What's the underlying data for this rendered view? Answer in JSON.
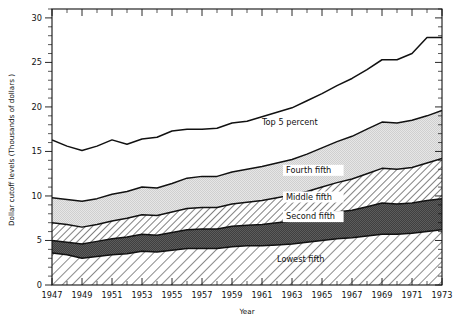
{
  "figure": {
    "ylabel": "Dollar cutoff levels (Thousands of dollars )",
    "xlabel": "Year"
  },
  "labels": {
    "top5": "Top 5 percent",
    "fourth": "Fourth fifth",
    "middle": "Middle fifth",
    "second": "Second fifth",
    "lowest": "Lowest fifth"
  },
  "colors": {
    "line": "#111111",
    "frame": "#111111",
    "lowest_fifth": "#f2f2f2",
    "second_fifth": "#4a4a4a",
    "middle_fifth": "#d8d8d8",
    "fourth_fifth": "#dcdcdc",
    "background": "#ffffff"
  },
  "chart_data": {
    "type": "area",
    "title": "",
    "xlabel": "Year",
    "ylabel": "Dollar cutoff levels (Thousands of dollars )",
    "xlim": [
      1947,
      1973
    ],
    "ylim": [
      0,
      31
    ],
    "grid": false,
    "legend": "inline-annotations",
    "yticks_major": [
      0,
      5,
      10,
      15,
      20,
      25,
      30
    ],
    "yticks_minor_step": 1,
    "xticks_major": [
      1947,
      1949,
      1951,
      1953,
      1955,
      1957,
      1959,
      1961,
      1963,
      1965,
      1967,
      1969,
      1971,
      1973
    ],
    "xticks_minor_step": 1,
    "x": [
      1947,
      1948,
      1949,
      1950,
      1951,
      1952,
      1953,
      1954,
      1955,
      1956,
      1957,
      1958,
      1959,
      1960,
      1961,
      1962,
      1963,
      1964,
      1965,
      1966,
      1967,
      1968,
      1969,
      1970,
      1971,
      1972,
      1973
    ],
    "series": [
      {
        "name": "Lowest fifth",
        "fill": "diagonal-hatch-light",
        "values": [
          3.6,
          3.4,
          3.0,
          3.2,
          3.4,
          3.5,
          3.8,
          3.7,
          3.9,
          4.1,
          4.1,
          4.1,
          4.3,
          4.4,
          4.4,
          4.5,
          4.6,
          4.8,
          5.0,
          5.2,
          5.3,
          5.5,
          5.7,
          5.7,
          5.8,
          6.0,
          6.2
        ]
      },
      {
        "name": "Second fifth",
        "fill": "solid-dark-gray",
        "values": [
          5.0,
          4.8,
          4.6,
          4.9,
          5.2,
          5.4,
          5.7,
          5.6,
          5.9,
          6.2,
          6.3,
          6.3,
          6.6,
          6.7,
          6.8,
          7.0,
          7.2,
          7.5,
          7.8,
          8.2,
          8.4,
          8.8,
          9.2,
          9.1,
          9.2,
          9.5,
          9.7
        ]
      },
      {
        "name": "Middle fifth",
        "fill": "diagonal-hatch-medium",
        "values": [
          7.0,
          6.8,
          6.5,
          6.8,
          7.2,
          7.5,
          7.9,
          7.8,
          8.2,
          8.6,
          8.7,
          8.7,
          9.1,
          9.3,
          9.5,
          9.8,
          10.1,
          10.5,
          11.0,
          11.5,
          11.9,
          12.5,
          13.1,
          13.0,
          13.2,
          13.7,
          14.2
        ]
      },
      {
        "name": "Fourth fifth",
        "fill": "fine-stipple-light",
        "values": [
          9.8,
          9.6,
          9.4,
          9.7,
          10.2,
          10.5,
          11.0,
          10.9,
          11.4,
          12.0,
          12.2,
          12.2,
          12.7,
          13.0,
          13.3,
          13.7,
          14.1,
          14.7,
          15.4,
          16.1,
          16.7,
          17.5,
          18.3,
          18.2,
          18.5,
          19.0,
          19.6
        ]
      },
      {
        "name": "Top 5 percent",
        "fill": "none",
        "values": [
          16.3,
          15.6,
          15.1,
          15.6,
          16.3,
          15.8,
          16.4,
          16.6,
          17.3,
          17.5,
          17.5,
          17.6,
          18.2,
          18.4,
          18.9,
          19.4,
          19.9,
          20.7,
          21.5,
          22.4,
          23.2,
          24.2,
          25.3,
          25.3,
          26.0,
          27.8,
          27.8
        ]
      }
    ]
  }
}
